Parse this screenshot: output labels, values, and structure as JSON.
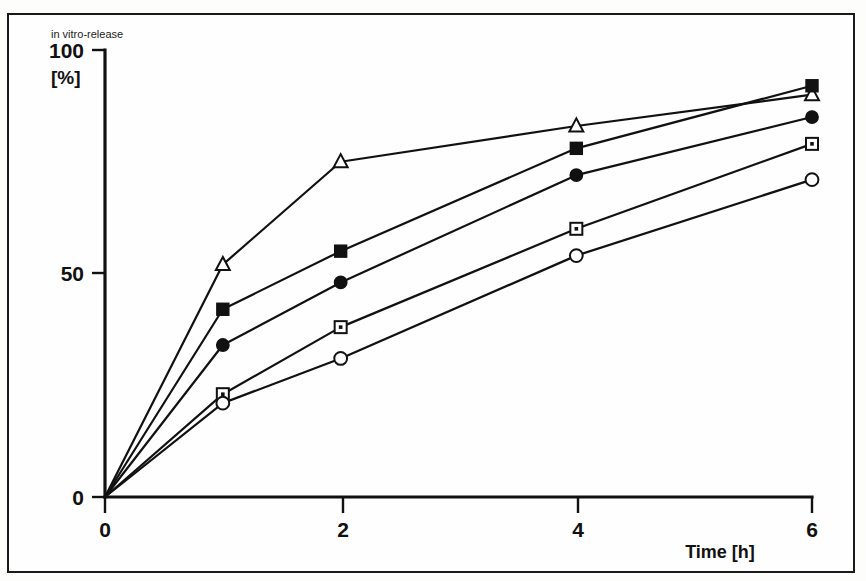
{
  "figure": {
    "background_color": "#fdfdfc",
    "frame_color": "#1a1a1a",
    "ink_color": "#111111"
  },
  "labels": {
    "y_caption": "in vitro-release",
    "y_unit": "[%]",
    "x_title": "Time [h]",
    "y_ticks": [
      "0",
      "50",
      "100"
    ],
    "x_ticks": [
      "0",
      "2",
      "4",
      "6"
    ]
  },
  "chart_data": {
    "type": "line",
    "title": "in vitro-release",
    "xlabel": "Time [h]",
    "ylabel": "in vitro-release [%]",
    "xlim": [
      0,
      6
    ],
    "ylim": [
      0,
      100
    ],
    "xticks": [
      0,
      2,
      4,
      6
    ],
    "yticks": [
      0,
      50,
      100
    ],
    "grid": false,
    "legend": "none",
    "x": [
      0,
      1,
      2,
      4,
      6
    ],
    "series": [
      {
        "name": "open-triangle",
        "marker": "triangle-open",
        "values": [
          0,
          52,
          75,
          83,
          90
        ]
      },
      {
        "name": "filled-square",
        "marker": "square-filled",
        "values": [
          0,
          42,
          55,
          78,
          92
        ]
      },
      {
        "name": "filled-circle",
        "marker": "circle-filled",
        "values": [
          0,
          34,
          48,
          72,
          85
        ]
      },
      {
        "name": "open-square",
        "marker": "square-open",
        "values": [
          0,
          23,
          38,
          60,
          79
        ]
      },
      {
        "name": "open-circle",
        "marker": "circle-open",
        "values": [
          0,
          21,
          31,
          54,
          71
        ]
      }
    ]
  }
}
